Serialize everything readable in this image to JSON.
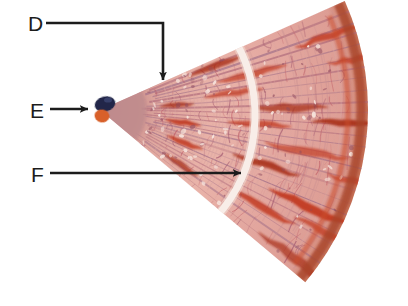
{
  "figure": {
    "kind": "histology-micrograph-with-labels",
    "background_color": "#ffffff",
    "labels": [
      {
        "id": "label-d",
        "text": "D",
        "text_x": 28,
        "text_y": 31,
        "target": "upper tissue band",
        "leader": "M46,23 L163,23 L163,80",
        "arrow_x": 163,
        "arrow_y": 86,
        "arrow_dir": "down"
      },
      {
        "id": "label-e",
        "text": "E",
        "text_x": 30,
        "text_y": 118,
        "target": "dark apex nodule",
        "leader": "M50,109 L88,109",
        "arrow_x": 95,
        "arrow_y": 109,
        "arrow_dir": "right"
      },
      {
        "id": "label-f",
        "text": "F",
        "text_x": 31,
        "text_y": 182,
        "target": "mid tissue streak",
        "leader": "M50,173 L241,173",
        "arrow_x": 249,
        "arrow_y": 173,
        "arrow_dir": "right"
      }
    ],
    "arrow_color": "#1c1c1c",
    "palette": {
      "tissue_pink": "#e3a79f",
      "tissue_pink_light": "#efc3bb",
      "tissue_mauve": "#c08c8e",
      "streak_red": "#c23a22",
      "streak_red_dark": "#a82d18",
      "fiber_purple": "#9b6a86",
      "apex_navy": "#222848",
      "apex_orange": "#d8602a",
      "gap_white": "#ffffff",
      "rim_brown": "#a8452c"
    },
    "geometry": {
      "apex_x": 100,
      "apex_y": 110,
      "outer_radius": 268,
      "start_angle_deg": -24,
      "end_angle_deg": 40,
      "white_gap_radius": 152,
      "white_gap_width": 7,
      "inner_mauve_radius": 46
    }
  }
}
